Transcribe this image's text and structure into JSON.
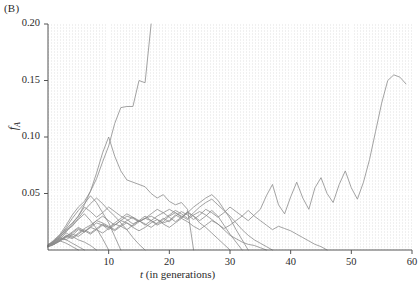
{
  "figure": {
    "panel_label": "(B)",
    "axis_color": "#555555",
    "trace_color": "#8c8c8c",
    "plot_bg": "#f2f2f2",
    "grid_color": "#ffffff"
  },
  "chart_data": {
    "type": "line",
    "title": "",
    "subtitle": "",
    "xlabel": "t (in generations)",
    "ylabel": "f_A",
    "xlim": [
      0,
      60
    ],
    "ylim": [
      0,
      0.2
    ],
    "xticks": [
      10,
      20,
      30,
      40,
      50,
      60
    ],
    "xtick_labels": [
      "10",
      "20",
      "30",
      "40",
      "50",
      "60"
    ],
    "yticks": [
      0.05,
      0.1,
      0.15,
      0.2
    ],
    "ytick_labels": [
      "0.05",
      "0.10",
      "0.15",
      "0.20"
    ],
    "grid": true,
    "legend": "none",
    "annotations": [
      "(B)"
    ],
    "series_count": 15,
    "series": [
      {
        "name": "replicate-1",
        "x": [
          0,
          1,
          2,
          3,
          4,
          5,
          6,
          7,
          8,
          9,
          10,
          11,
          12,
          13,
          14,
          15,
          16,
          17
        ],
        "values": [
          0.005,
          0.008,
          0.013,
          0.019,
          0.024,
          0.03,
          0.04,
          0.052,
          0.063,
          0.078,
          0.092,
          0.112,
          0.126,
          0.127,
          0.127,
          0.15,
          0.148,
          0.2
        ]
      },
      {
        "name": "replicate-2",
        "x": [
          0,
          1,
          2,
          3,
          4,
          5,
          6,
          7,
          8,
          9,
          10,
          11,
          12,
          13,
          14,
          15,
          16,
          17,
          18,
          19,
          20,
          21,
          22,
          23,
          24
        ],
        "values": [
          0.004,
          0.009,
          0.014,
          0.022,
          0.031,
          0.038,
          0.043,
          0.052,
          0.068,
          0.086,
          0.1,
          0.083,
          0.07,
          0.062,
          0.06,
          0.058,
          0.056,
          0.05,
          0.046,
          0.049,
          0.043,
          0.04,
          0.042,
          0.036,
          0.0
        ]
      },
      {
        "name": "replicate-3",
        "x": [
          0,
          1,
          2,
          3,
          4,
          5,
          6,
          7,
          8,
          9,
          10,
          11,
          12,
          13,
          14,
          15,
          16
        ],
        "values": [
          0.003,
          0.006,
          0.011,
          0.018,
          0.021,
          0.028,
          0.035,
          0.041,
          0.046,
          0.041,
          0.035,
          0.03,
          0.024,
          0.018,
          0.011,
          0.005,
          0.0
        ]
      },
      {
        "name": "replicate-4",
        "x": [
          0,
          1,
          2,
          3,
          4,
          5,
          6,
          7,
          8,
          9,
          10,
          11,
          12,
          13,
          14,
          15,
          16,
          17,
          18,
          19,
          20,
          21,
          22,
          23,
          24,
          25,
          26,
          27,
          28,
          29,
          30
        ],
        "values": [
          0.004,
          0.007,
          0.01,
          0.009,
          0.013,
          0.018,
          0.016,
          0.021,
          0.026,
          0.03,
          0.026,
          0.022,
          0.026,
          0.03,
          0.028,
          0.025,
          0.028,
          0.03,
          0.027,
          0.024,
          0.026,
          0.031,
          0.028,
          0.033,
          0.03,
          0.024,
          0.02,
          0.015,
          0.01,
          0.005,
          0.0
        ]
      },
      {
        "name": "replicate-5",
        "x": [
          0,
          1,
          2,
          3,
          4,
          5,
          6,
          7,
          8,
          9,
          10,
          11,
          12,
          13,
          14,
          15,
          16,
          17,
          18,
          19,
          20,
          21,
          22,
          23,
          24,
          25,
          26,
          27,
          28,
          29,
          30,
          31,
          32,
          33,
          34,
          35,
          36
        ],
        "values": [
          0.003,
          0.005,
          0.009,
          0.012,
          0.015,
          0.019,
          0.016,
          0.02,
          0.024,
          0.022,
          0.018,
          0.022,
          0.026,
          0.024,
          0.021,
          0.025,
          0.028,
          0.026,
          0.022,
          0.025,
          0.03,
          0.033,
          0.03,
          0.027,
          0.031,
          0.034,
          0.031,
          0.027,
          0.023,
          0.018,
          0.013,
          0.01,
          0.007,
          0.005,
          0.004,
          0.002,
          0.0
        ]
      },
      {
        "name": "replicate-6",
        "x": [
          0,
          1,
          2,
          3,
          4,
          5,
          6,
          7,
          8,
          9,
          10,
          11,
          12,
          13,
          14,
          15,
          16,
          17,
          18,
          19,
          20,
          21,
          22,
          23,
          24,
          25,
          26,
          27,
          28,
          29,
          30,
          31,
          32,
          33,
          34,
          35,
          36,
          37,
          38,
          39,
          40,
          41,
          42,
          43,
          44,
          45,
          46
        ],
        "values": [
          0.004,
          0.006,
          0.008,
          0.012,
          0.01,
          0.014,
          0.018,
          0.015,
          0.019,
          0.023,
          0.02,
          0.017,
          0.021,
          0.024,
          0.02,
          0.017,
          0.02,
          0.024,
          0.027,
          0.023,
          0.02,
          0.024,
          0.028,
          0.025,
          0.021,
          0.018,
          0.022,
          0.026,
          0.023,
          0.019,
          0.022,
          0.026,
          0.03,
          0.035,
          0.03,
          0.026,
          0.022,
          0.018,
          0.021,
          0.019,
          0.017,
          0.014,
          0.011,
          0.008,
          0.005,
          0.003,
          0.0
        ]
      },
      {
        "name": "replicate-7",
        "x": [
          0,
          1,
          2,
          3,
          4,
          5,
          6,
          7,
          8,
          9,
          10,
          11,
          12,
          13,
          14,
          15,
          16,
          17,
          18,
          19,
          20,
          21,
          22,
          23,
          24,
          25,
          26,
          27,
          28,
          29,
          30,
          31,
          32,
          33,
          34,
          35,
          36,
          37,
          38,
          39,
          40,
          41,
          42,
          43,
          44,
          45,
          46,
          47,
          48,
          49,
          50,
          51,
          52,
          53,
          54,
          55,
          56,
          57,
          58,
          59
        ],
        "values": [
          0.003,
          0.005,
          0.008,
          0.011,
          0.014,
          0.012,
          0.016,
          0.02,
          0.018,
          0.015,
          0.019,
          0.023,
          0.021,
          0.018,
          0.022,
          0.026,
          0.023,
          0.02,
          0.024,
          0.028,
          0.025,
          0.03,
          0.034,
          0.031,
          0.027,
          0.031,
          0.036,
          0.033,
          0.029,
          0.033,
          0.038,
          0.034,
          0.03,
          0.026,
          0.031,
          0.036,
          0.048,
          0.058,
          0.04,
          0.032,
          0.047,
          0.06,
          0.046,
          0.036,
          0.055,
          0.064,
          0.05,
          0.042,
          0.058,
          0.07,
          0.055,
          0.045,
          0.06,
          0.08,
          0.105,
          0.13,
          0.15,
          0.155,
          0.153,
          0.147
        ]
      },
      {
        "name": "replicate-8",
        "x": [
          0,
          1,
          2,
          3,
          4,
          5,
          6,
          7,
          8,
          9,
          10,
          11,
          12,
          13,
          14,
          15,
          16,
          17,
          18,
          19,
          20,
          21,
          22,
          23,
          24,
          25,
          26,
          27,
          28,
          29,
          30,
          31,
          32,
          33,
          34,
          35,
          36,
          37
        ],
        "values": [
          0.004,
          0.007,
          0.012,
          0.017,
          0.023,
          0.03,
          0.038,
          0.034,
          0.029,
          0.033,
          0.038,
          0.034,
          0.03,
          0.027,
          0.023,
          0.026,
          0.03,
          0.026,
          0.023,
          0.027,
          0.031,
          0.035,
          0.032,
          0.028,
          0.033,
          0.038,
          0.042,
          0.045,
          0.04,
          0.035,
          0.03,
          0.024,
          0.018,
          0.013,
          0.009,
          0.006,
          0.003,
          0.0
        ]
      },
      {
        "name": "replicate-9",
        "x": [
          0,
          1,
          2,
          3,
          4,
          5,
          6,
          7,
          8,
          9,
          10,
          11,
          12
        ],
        "values": [
          0.004,
          0.008,
          0.013,
          0.02,
          0.028,
          0.035,
          0.041,
          0.048,
          0.042,
          0.033,
          0.024,
          0.012,
          0.0
        ]
      },
      {
        "name": "replicate-10",
        "x": [
          0,
          1,
          2,
          3,
          4,
          5,
          6,
          7,
          8,
          9,
          10
        ],
        "values": [
          0.003,
          0.007,
          0.012,
          0.016,
          0.022,
          0.027,
          0.032,
          0.026,
          0.019,
          0.01,
          0.0
        ]
      },
      {
        "name": "replicate-11",
        "x": [
          0,
          1,
          2,
          3,
          4,
          5,
          6,
          7,
          8
        ],
        "values": [
          0.003,
          0.006,
          0.01,
          0.015,
          0.012,
          0.009,
          0.007,
          0.004,
          0.0
        ]
      },
      {
        "name": "replicate-12",
        "x": [
          0,
          1,
          2,
          3,
          4,
          5,
          6
        ],
        "values": [
          0.004,
          0.008,
          0.011,
          0.009,
          0.006,
          0.003,
          0.0
        ]
      },
      {
        "name": "replicate-13",
        "x": [
          0,
          1,
          2,
          3,
          4,
          5
        ],
        "values": [
          0.003,
          0.005,
          0.008,
          0.006,
          0.003,
          0.0
        ]
      },
      {
        "name": "replicate-14",
        "x": [
          0,
          1,
          2,
          3,
          4,
          5,
          6,
          7,
          8,
          9,
          10,
          11,
          12,
          13,
          14,
          15,
          16,
          17,
          18,
          19,
          20,
          21,
          22,
          23,
          24,
          25,
          26,
          27,
          28,
          29,
          30,
          31,
          32,
          33
        ],
        "values": [
          0.004,
          0.006,
          0.009,
          0.013,
          0.011,
          0.015,
          0.019,
          0.022,
          0.026,
          0.024,
          0.021,
          0.018,
          0.022,
          0.026,
          0.029,
          0.026,
          0.022,
          0.026,
          0.03,
          0.033,
          0.036,
          0.033,
          0.029,
          0.033,
          0.038,
          0.042,
          0.046,
          0.049,
          0.044,
          0.036,
          0.028,
          0.018,
          0.009,
          0.0
        ]
      },
      {
        "name": "replicate-15",
        "x": [
          0,
          1,
          2,
          3,
          4,
          5,
          6,
          7,
          8,
          9,
          10,
          11,
          12,
          13,
          14,
          15,
          16,
          17,
          18,
          19,
          20,
          21,
          22,
          23,
          24,
          25,
          26,
          27,
          28,
          29,
          30,
          31,
          32
        ],
        "values": [
          0.003,
          0.005,
          0.009,
          0.012,
          0.016,
          0.02,
          0.017,
          0.014,
          0.018,
          0.022,
          0.02,
          0.024,
          0.028,
          0.032,
          0.029,
          0.025,
          0.028,
          0.032,
          0.036,
          0.033,
          0.029,
          0.025,
          0.029,
          0.034,
          0.03,
          0.026,
          0.03,
          0.035,
          0.03,
          0.022,
          0.014,
          0.007,
          0.0
        ]
      }
    ]
  }
}
